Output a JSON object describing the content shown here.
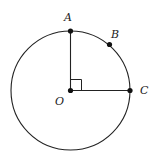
{
  "diagram": {
    "center": {
      "label": "O",
      "x": 70.5,
      "y": 90.5
    },
    "radius": 59.5,
    "points": [
      {
        "label": "A",
        "x": 70.5,
        "y": 31,
        "lx": 67,
        "ly": 20
      },
      {
        "label": "B",
        "x": 109.5,
        "y": 44.5,
        "lx": 113,
        "ly": 37
      },
      {
        "label": "C",
        "x": 130,
        "y": 90.5,
        "lx": 141,
        "ly": 94
      }
    ],
    "right_angle_marker": {
      "at": "O",
      "size": 11
    },
    "segments": [
      "OA",
      "OC"
    ],
    "colors": {
      "stroke": "#222222",
      "background": "#ffffff"
    }
  }
}
